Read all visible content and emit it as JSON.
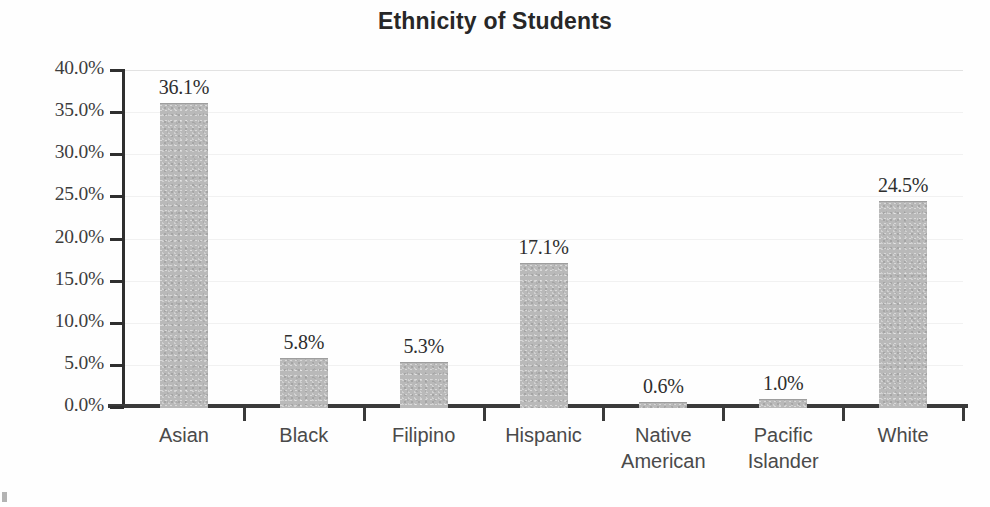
{
  "chart_data": {
    "type": "bar",
    "title": "Ethnicity of Students",
    "xlabel": "",
    "ylabel": "",
    "categories": [
      "Asian",
      "Black",
      "Filipino",
      "Hispanic",
      "Native American",
      "Pacific Islander",
      "White"
    ],
    "values": [
      36.1,
      5.8,
      5.3,
      17.1,
      0.6,
      1.0,
      24.5
    ],
    "value_labels": [
      "36.1%",
      "5.8%",
      "5.3%",
      "17.1%",
      "0.6%",
      "1.0%",
      "24.5%"
    ],
    "ylim": [
      0,
      40
    ],
    "ytick_values": [
      0,
      5,
      10,
      15,
      20,
      25,
      30,
      35,
      40
    ],
    "ytick_labels": [
      "0.0%",
      "5.0%",
      "10.0%",
      "15.0%",
      "20.0%",
      "25.0%",
      "30.0%",
      "35.0%",
      "40.0%"
    ],
    "grid": true,
    "legend": null,
    "legend_position": "none",
    "series": [
      {
        "name": "Percent of students",
        "values": [
          36.1,
          5.8,
          5.3,
          17.1,
          0.6,
          1.0,
          24.5
        ]
      }
    ],
    "bar_color": "#b9b9b9",
    "text_color": "#2e2e2e",
    "axis_color": "#3a3a3a"
  },
  "axis": {
    "y_ticks": [
      {
        "label": "40.0%",
        "value": 40
      },
      {
        "label": "35.0%",
        "value": 35
      },
      {
        "label": "30.0%",
        "value": 30
      },
      {
        "label": "25.0%",
        "value": 25
      },
      {
        "label": "20.0%",
        "value": 20
      },
      {
        "label": "15.0%",
        "value": 15
      },
      {
        "label": "10.0%",
        "value": 10
      },
      {
        "label": "5.0%",
        "value": 5
      },
      {
        "label": "0.0%",
        "value": 0
      }
    ],
    "x_categories": [
      {
        "label": "Asian",
        "line1": "Asian",
        "line2": ""
      },
      {
        "label": "Black",
        "line1": "Black",
        "line2": ""
      },
      {
        "label": "Filipino",
        "line1": "Filipino",
        "line2": ""
      },
      {
        "label": "Hispanic",
        "line1": "Hispanic",
        "line2": ""
      },
      {
        "label": "Native American",
        "line1": "Native",
        "line2": "American"
      },
      {
        "label": "Pacific Islander",
        "line1": "Pacific",
        "line2": "Islander"
      },
      {
        "label": "White",
        "line1": "White",
        "line2": ""
      }
    ]
  }
}
